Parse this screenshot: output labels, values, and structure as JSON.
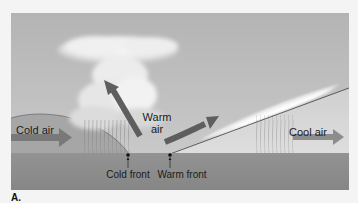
{
  "figure": {
    "panel_label": "A.",
    "labels": {
      "cold_air": "Cold air",
      "warm_air_line1": "Warm",
      "warm_air_line2": "air",
      "cool_air": "Cool air",
      "cold_front": "Cold front",
      "warm_front": "Warm front"
    },
    "colors": {
      "sky": "#b9b9b9",
      "ground": "#8d8d8d",
      "cold_air_mass": "#a4a4a4",
      "arrow": "#6f6f6f",
      "front_line": "#2a2a2a",
      "cloud": "#f2f2f2",
      "page_background": "#f4f4f4"
    }
  }
}
